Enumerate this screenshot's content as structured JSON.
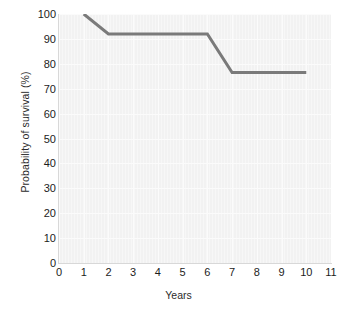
{
  "chart_data": {
    "type": "line",
    "title": "",
    "subtitle": "",
    "xlabel": "Years",
    "ylabel": "Probability of survival (%)",
    "xlim": [
      0,
      11
    ],
    "ylim": [
      0,
      100
    ],
    "xticks": [
      0,
      1,
      2,
      3,
      4,
      5,
      6,
      7,
      8,
      9,
      10,
      11
    ],
    "xticklabels": [
      "0",
      "1",
      "2",
      "3",
      "4",
      "5",
      "6",
      "7",
      "8",
      "9",
      "10",
      "11"
    ],
    "yticks": [
      0,
      10,
      20,
      30,
      40,
      50,
      60,
      70,
      80,
      90,
      100
    ],
    "yticklabels": [
      "0",
      "10",
      "20",
      "30",
      "40",
      "50",
      "60",
      "70",
      "80",
      "90",
      "100"
    ],
    "grid": true,
    "legend": null,
    "legend_position": "none",
    "plot_background": "#f2f2f2",
    "grid_color": "#fbfbfb",
    "line_color": "#7a7a7a",
    "line_width": 3,
    "series": [
      {
        "name": "Survival curve",
        "x": [
          1,
          2,
          6,
          7,
          10
        ],
        "values": [
          100,
          92,
          92,
          76.5,
          76.5
        ]
      }
    ],
    "annotations": []
  },
  "axes": {
    "y_title": "Probability of survival (%)",
    "x_title": "Years"
  }
}
